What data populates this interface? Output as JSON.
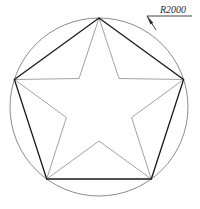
{
  "drawing": {
    "title": "star-in-circle-geometric-drawing",
    "background_color": "#ffffff",
    "canvas": {
      "width": 200,
      "height": 209
    },
    "annotation": {
      "label": "R2000",
      "radius_value": 2000,
      "prefix": "R",
      "style": "italic-underlined",
      "text_color": "#2b2b2b",
      "text_x": 160,
      "text_y": 13,
      "underline": {
        "x1": 147,
        "y1": 16,
        "x2": 192,
        "y2": 16
      },
      "leader": {
        "x1": 147,
        "y1": 16,
        "x2": 156,
        "y2": 30
      },
      "arrow_tip": {
        "x": 155,
        "y": 30
      },
      "arrow_angle_deg": 57
    },
    "circle": {
      "name": "reference-circle",
      "cx": 99,
      "cy": 107,
      "r": 89,
      "stroke_color": "#6e6e6e",
      "stroke_width": 0.8,
      "fill": "none"
    },
    "pentagon": {
      "name": "inscribed-pentagon",
      "stroke_color": "#1a1a1a",
      "stroke_width": 1.3,
      "fill": "none",
      "vertices": [
        {
          "label": "top",
          "x": 99,
          "y": 18
        },
        {
          "label": "right",
          "x": 183.6,
          "y": 79.5
        },
        {
          "label": "bottom-right",
          "x": 151.3,
          "y": 179
        },
        {
          "label": "bottom-left",
          "x": 46.7,
          "y": 179
        },
        {
          "label": "left",
          "x": 14.4,
          "y": 79.5
        }
      ]
    },
    "star": {
      "name": "five-pointed-star",
      "stroke_color": "#8a8a8a",
      "stroke_width": 0.8,
      "fill": "none",
      "outer_radius": 89,
      "inner_radius": 34,
      "points": 5,
      "vertices": [
        {
          "type": "outer",
          "x": 99,
          "y": 18
        },
        {
          "type": "inner",
          "x": 119,
          "y": 78.5
        },
        {
          "type": "outer",
          "x": 183.6,
          "y": 79.5
        },
        {
          "type": "inner",
          "x": 131.6,
          "y": 117.5
        },
        {
          "type": "outer",
          "x": 151.3,
          "y": 179
        },
        {
          "type": "inner",
          "x": 99,
          "y": 141
        },
        {
          "type": "outer",
          "x": 46.7,
          "y": 179
        },
        {
          "type": "inner",
          "x": 66.4,
          "y": 117.5
        },
        {
          "type": "outer",
          "x": 14.4,
          "y": 79.5
        },
        {
          "type": "inner",
          "x": 79,
          "y": 78.5
        }
      ]
    }
  }
}
